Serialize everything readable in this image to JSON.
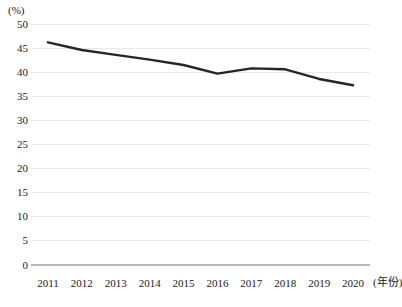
{
  "chart_data": {
    "type": "line",
    "title": "",
    "subtitle": "",
    "xlabel": "(年份)",
    "ylabel": "(%)",
    "categories": [
      "2011",
      "2012",
      "2013",
      "2014",
      "2015",
      "2016",
      "2017",
      "2018",
      "2019",
      "2020"
    ],
    "x": [
      2011,
      2012,
      2013,
      2014,
      2015,
      2016,
      2017,
      2018,
      2019,
      2020
    ],
    "series": [
      {
        "name": "",
        "values": [
          46.2,
          44.6,
          43.6,
          42.6,
          41.5,
          39.7,
          40.8,
          40.6,
          38.6,
          37.3
        ]
      }
    ],
    "ylim": [
      0,
      50
    ],
    "ytick_values": [
      0,
      5,
      10,
      15,
      20,
      25,
      30,
      35,
      40,
      45,
      50
    ],
    "ytick_labels": [
      "0",
      "5",
      "10",
      "15",
      "20",
      "25",
      "30",
      "35",
      "40",
      "45",
      "50"
    ],
    "grid": true,
    "grid_axis": "y",
    "legend": false,
    "legend_position": "none",
    "line_color": "#262626",
    "line_width": 2.4,
    "markers": false,
    "grid_color": "#e9e9e9",
    "axis_color": "#b9b9b9",
    "background_color": "#ffffff"
  }
}
